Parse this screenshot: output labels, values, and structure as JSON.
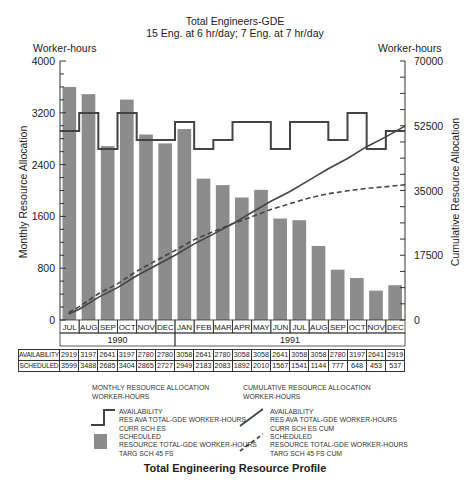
{
  "header": {
    "title": "Total Engineers-GDE",
    "subtitle": "15 Eng. at 6 hr/day; 7 Eng. at 7 hr/day",
    "left_unit": "Worker-hours",
    "right_unit": "Worker-hours"
  },
  "footer": {
    "title": "Total Engineering Resource Profile"
  },
  "colors": {
    "bar": "#8c8c8c",
    "line": "#444444",
    "text": "#222222"
  },
  "table": {
    "row_labels": [
      "AVAILABILITY",
      "SCHEDULED"
    ]
  },
  "legend": {
    "monthly_head": [
      "MONTHLY RESOURCE ALLOCATION",
      "WORKER-HOURS"
    ],
    "monthly_availability": [
      "AVAILABILITY",
      "RES AVA TOTAL-GDE WORKER-HOURS",
      "CURR SCH ES"
    ],
    "monthly_scheduled": [
      "SCHEDULED",
      "RESOURCE TOTAL-GDE WORKER-HOURS",
      "TARG SCH 45 FS"
    ],
    "cumulative_head": [
      "CUMULATIVE RESOURCE ALLOCATION",
      "WORKER-HOURS"
    ],
    "cumulative_availability": [
      "AVAILABILITY",
      "RES AVA TOTAL-GDE WORKER-HOURS",
      "CURR SCH ES CUM"
    ],
    "cumulative_scheduled": [
      "SCHEDULED",
      "RESOURCE TOTAL-GDE WORKER-HOURS",
      "TARG SCH 45 FS CUM"
    ]
  },
  "chart_data": {
    "type": "bar",
    "title": "Total Engineers-GDE",
    "subtitle": "15 Eng. at 6 hr/day; 7 Eng. at 7 hr/day",
    "footer_title": "Total Engineering Resource Profile",
    "categories": [
      "JUL",
      "AUG",
      "SEP",
      "OCT",
      "NOV",
      "DEC",
      "JAN",
      "FEB",
      "MAR",
      "APR",
      "MAY",
      "JUN",
      "JUL",
      "AUG",
      "SEP",
      "OCT",
      "NOV",
      "DEC"
    ],
    "years": [
      {
        "label": "1990",
        "span": 6
      },
      {
        "label": "1991",
        "span": 12
      }
    ],
    "ylabel": "Monthly Resource Allocation",
    "ylabel_unit": "Worker-hours",
    "ylim": [
      0,
      4000
    ],
    "yticks": [
      0,
      800,
      1600,
      2400,
      3200,
      4000
    ],
    "y2label": "Cumulative Resource Allocation",
    "y2label_unit": "Worker-hours",
    "y2lim": [
      0,
      70000
    ],
    "y2ticks": [
      0,
      17500,
      35000,
      52500,
      70000
    ],
    "series": [
      {
        "name": "Scheduled (monthly)",
        "type": "bar",
        "axis": "left",
        "values": [
          3599,
          3488,
          2685,
          3404,
          2865,
          2727,
          2949,
          2183,
          2083,
          1892,
          2010,
          1567,
          1541,
          1144,
          777,
          648,
          453,
          537
        ]
      },
      {
        "name": "Availability (monthly)",
        "type": "step",
        "axis": "left",
        "values": [
          2919,
          3197,
          2641,
          3197,
          2780,
          2780,
          3058,
          2641,
          2780,
          3058,
          3058,
          2641,
          3058,
          3058,
          2780,
          3197,
          2641,
          2919
        ]
      },
      {
        "name": "Availability (cumulative)",
        "type": "line",
        "style": "solid",
        "axis": "right",
        "values": [
          2919,
          6116,
          8757,
          11954,
          14734,
          17514,
          20572,
          23213,
          25993,
          29051,
          32109,
          34750,
          37808,
          40866,
          43646,
          46843,
          49484,
          52403
        ]
      },
      {
        "name": "Scheduled (cumulative)",
        "type": "line",
        "style": "dashed",
        "axis": "right",
        "values": [
          3599,
          7087,
          9772,
          13176,
          16041,
          18768,
          21717,
          23900,
          25983,
          27875,
          29885,
          31452,
          32993,
          34137,
          34914,
          35562,
          36015,
          36552
        ]
      }
    ],
    "grid": false,
    "legend_position": "bottom"
  }
}
